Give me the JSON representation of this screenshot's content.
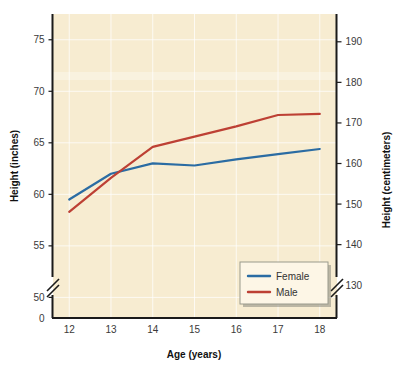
{
  "chart_data": {
    "type": "line",
    "title": "",
    "xlabel": "Age (years)",
    "ylabel": "Height (inches)",
    "ylabel_right": "Height (centimeters)",
    "x": [
      12,
      13,
      14,
      15,
      16,
      17,
      18
    ],
    "xlim": [
      11.6,
      18.4
    ],
    "ylim": [
      48.0,
      77.5
    ],
    "y_axis_broken": true,
    "y_break_to_zero": true,
    "grid": true,
    "legend_position": "bottom-right",
    "series": [
      {
        "name": "Female",
        "color": "#2b6ca3",
        "values": [
          59.5,
          62.0,
          63.0,
          62.8,
          63.4,
          63.9,
          64.4
        ]
      },
      {
        "name": "Male",
        "color": "#bd4034",
        "values": [
          58.3,
          61.6,
          64.6,
          65.6,
          66.6,
          67.7,
          67.8
        ]
      }
    ],
    "left_axis": {
      "label": "Height (inches)",
      "ticks": [
        50,
        55,
        60,
        65,
        70,
        75
      ],
      "tick_labels": [
        "50",
        "55",
        "60",
        "65",
        "70",
        "75"
      ],
      "zero_label": "0"
    },
    "right_axis": {
      "label": "Height (centimeters)",
      "ticks": [
        130,
        140,
        150,
        160,
        170,
        180,
        190,
        200
      ],
      "tick_labels": [
        "130",
        "140",
        "150",
        "160",
        "170",
        "180",
        "190",
        "200"
      ]
    },
    "x_axis": {
      "label": "Age (years)",
      "ticks": [
        12,
        13,
        14,
        15,
        16,
        17,
        18
      ],
      "tick_labels": [
        "12",
        "13",
        "14",
        "15",
        "16",
        "17",
        "18"
      ]
    },
    "legend": {
      "entries": [
        {
          "label": "Female",
          "color": "#2b6ca3"
        },
        {
          "label": "Male",
          "color": "#bd4034"
        }
      ]
    },
    "colors": {
      "plot_background": "#f7ecd1",
      "page_background": "#ffffff",
      "axis": "#1a1a1a",
      "gridline": "#ffffff",
      "female": "#2b6ca3",
      "male": "#bd4034"
    }
  }
}
